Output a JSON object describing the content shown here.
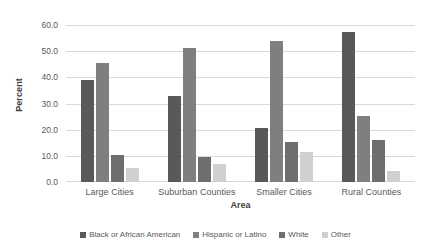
{
  "chart_data": {
    "type": "bar",
    "title": "",
    "subtitle": "",
    "xlabel": "Area",
    "ylabel": "Percent",
    "ylim": [
      0,
      60
    ],
    "ytick_step": 10,
    "ytick_labels": [
      "0.0",
      "10.0",
      "20.0",
      "30.0",
      "40.0",
      "50.0",
      "60.0"
    ],
    "grid": "horizontal",
    "legend_position": "bottom",
    "categories": [
      "Large Cities",
      "Suburban Counties",
      "Smaller Cities",
      "Rural Counties"
    ],
    "series": [
      {
        "name": "Black or African American",
        "color": "#595959",
        "values": [
          39.0,
          32.9,
          20.7,
          57.4
        ]
      },
      {
        "name": "Hispanic or Latino",
        "color": "#7F7F7F",
        "values": [
          45.5,
          51.4,
          54.0,
          25.4
        ]
      },
      {
        "name": "White",
        "color": "#6E6E6E",
        "values": [
          10.4,
          9.4,
          15.3,
          16.0
        ]
      },
      {
        "name": "Other",
        "color": "#D0D0D0",
        "values": [
          5.5,
          7.0,
          11.4,
          4.3
        ]
      }
    ]
  }
}
